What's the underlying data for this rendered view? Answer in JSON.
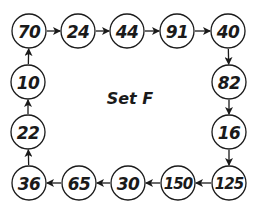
{
  "title": "Set F",
  "nodes": [
    {
      "id": "n0",
      "value": "70",
      "cx": 29,
      "cy": 31
    },
    {
      "id": "n1",
      "value": "24",
      "cx": 78,
      "cy": 31
    },
    {
      "id": "n2",
      "value": "44",
      "cx": 127,
      "cy": 31
    },
    {
      "id": "n3",
      "value": "91",
      "cx": 177,
      "cy": 31
    },
    {
      "id": "n4",
      "value": "40",
      "cx": 228,
      "cy": 31
    },
    {
      "id": "n5",
      "value": "82",
      "cx": 229,
      "cy": 82
    },
    {
      "id": "n6",
      "value": "16",
      "cx": 229,
      "cy": 132
    },
    {
      "id": "n7",
      "value": "125",
      "cx": 229,
      "cy": 183
    },
    {
      "id": "n8",
      "value": "150",
      "cx": 178,
      "cy": 183
    },
    {
      "id": "n9",
      "value": "30",
      "cx": 128,
      "cy": 183
    },
    {
      "id": "n10",
      "value": "65",
      "cx": 79,
      "cy": 183
    },
    {
      "id": "n11",
      "value": "36",
      "cx": 29,
      "cy": 183
    },
    {
      "id": "n12",
      "value": "22",
      "cx": 28,
      "cy": 132
    },
    {
      "id": "n13",
      "value": "10",
      "cx": 28,
      "cy": 82
    }
  ],
  "edges": [
    [
      "n0",
      "n1"
    ],
    [
      "n1",
      "n2"
    ],
    [
      "n2",
      "n3"
    ],
    [
      "n3",
      "n4"
    ],
    [
      "n4",
      "n5"
    ],
    [
      "n5",
      "n6"
    ],
    [
      "n6",
      "n7"
    ],
    [
      "n7",
      "n8"
    ],
    [
      "n8",
      "n9"
    ],
    [
      "n9",
      "n10"
    ],
    [
      "n10",
      "n11"
    ],
    [
      "n11",
      "n12"
    ],
    [
      "n12",
      "n13"
    ],
    [
      "n13",
      "n0"
    ]
  ],
  "style": {
    "radius": 17,
    "stroke": "#1a1a1a",
    "fill": "#ffffff"
  }
}
